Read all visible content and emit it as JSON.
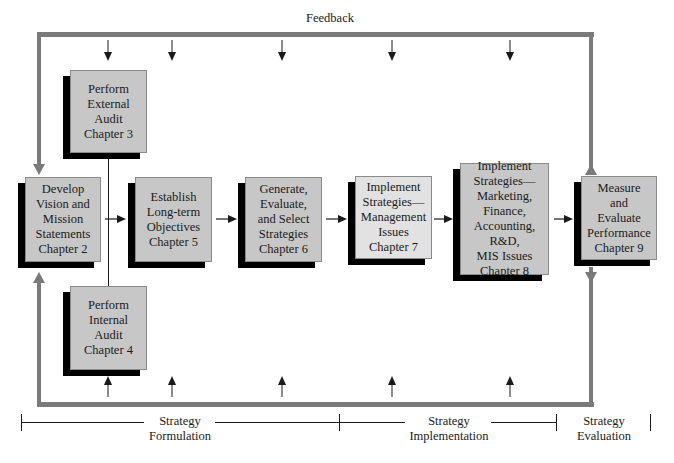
{
  "diagram": {
    "feedback_label": "Feedback",
    "boxes": [
      {
        "id": "external-audit",
        "label": "Perform\nExternal\nAudit\nChapter 3"
      },
      {
        "id": "vision-mission",
        "label": "Develop\nVision and\nMission\nStatements\nChapter 2"
      },
      {
        "id": "long-term-objectives",
        "label": "Establish\nLong-term\nObjectives\nChapter 5"
      },
      {
        "id": "generate-strategies",
        "label": "Generate,\nEvaluate,\nand Select\nStrategies\nChapter 6"
      },
      {
        "id": "management-issues",
        "label": "Implement\nStrategies—\nManagement\nIssues\nChapter 7"
      },
      {
        "id": "functional-issues",
        "label": "Implement\nStrategies—\nMarketing,\nFinance,\nAccounting, R&D,\nMIS Issues\nChapter 8"
      },
      {
        "id": "measure-evaluate",
        "label": "Measure\nand\nEvaluate\nPerformance\nChapter 9"
      },
      {
        "id": "internal-audit",
        "label": "Perform\nInternal\nAudit\nChapter 4"
      }
    ],
    "stages": [
      {
        "label": "Strategy\nFormulation"
      },
      {
        "label": "Strategy\nImplementation"
      },
      {
        "label": "Strategy\nEvaluation"
      }
    ],
    "colors": {
      "feedback_loop": "#7a7a7a",
      "box_fill": "#c7c7c7",
      "box_fill_light": "#e2e2e2",
      "box_shadow": "#000000"
    }
  }
}
